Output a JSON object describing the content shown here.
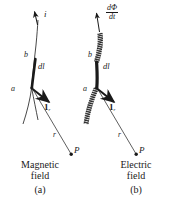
{
  "figure": {
    "panels": [
      {
        "id": "a",
        "caption": "(a)",
        "field_label_line1": "Magnetic",
        "field_label_line2": "field",
        "source_label": "i",
        "source_kind": "current-arrow",
        "point_a": "a",
        "point_b": "b",
        "segment_label": "dl",
        "unit_vector": "1",
        "unit_vector_sub": "r",
        "distance_label": "r",
        "field_point": "P"
      },
      {
        "id": "b",
        "caption": "(b)",
        "field_label_line1": "Electric",
        "field_label_line2": "field",
        "source_num": "dΦ",
        "source_den": "dt",
        "source_kind": "flux-rate-arrow",
        "point_a": "a",
        "point_b": "b",
        "segment_label": "dl",
        "unit_vector": "1",
        "unit_vector_sub": "r",
        "distance_label": "r",
        "field_point": "P"
      }
    ],
    "colors": {
      "ink": "#1a1a1a",
      "background": "#ffffff"
    }
  }
}
